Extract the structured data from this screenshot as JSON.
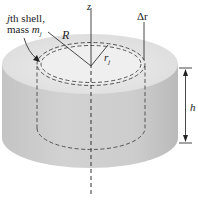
{
  "figure": {
    "labels": {
      "shell_line1": "jth shell,",
      "shell_line1_var": "j",
      "shell_line1_rest": "th shell,",
      "shell_line2": "mass m",
      "shell_line2_pre": "mass ",
      "shell_line2_var": "m",
      "shell_line2_sub": "j",
      "z_axis": "z",
      "outer_radius": "R",
      "shell_radius": "r",
      "shell_radius_sub": "j",
      "thickness": "Δr",
      "height": "h"
    },
    "colors": {
      "top_face": "#e2e2e2",
      "inner_top": "#ececec",
      "side": "#cbcbcb",
      "side_dark": "#bdbdbd",
      "lines": "#333333",
      "dashes": "#555555"
    }
  }
}
